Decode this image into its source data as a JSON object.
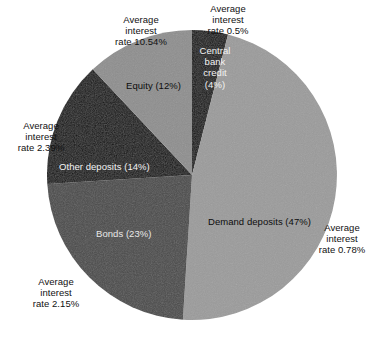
{
  "chart_data": {
    "type": "pie",
    "title": "",
    "subtitle": "",
    "xlabel": "",
    "ylabel": "",
    "legend_position": "none",
    "grid": false,
    "start_angle_deg": 0,
    "direction": "clockwise",
    "center": {
      "x": 192,
      "y": 175
    },
    "radius": 145,
    "categories": [
      "Central bank credit",
      "Demand deposits",
      "Bonds",
      "Other deposits",
      "Equity"
    ],
    "values": [
      4,
      47,
      23,
      14,
      12
    ],
    "value_unit": "percent",
    "total": 100,
    "slices": [
      {
        "name": "Central bank credit",
        "value": 4,
        "wedge_label": "Central\nbank\ncredit\n(4%)",
        "wedge_label_color": "#f2f2f2",
        "annotation": "Average\ninterest\nrate 0.5%",
        "average_interest_rate": 0.5,
        "color": "#0e0e0e",
        "start_angle_deg": 0,
        "end_angle_deg": 14.4
      },
      {
        "name": "Demand deposits",
        "value": 47,
        "wedge_label": "Demand deposits (47%)",
        "wedge_label_color": "#0d0d0d",
        "annotation": "Average\ninterest\nrate 0.78%",
        "average_interest_rate": 0.78,
        "color": "#9b9b9b",
        "start_angle_deg": 14.4,
        "end_angle_deg": 183.6
      },
      {
        "name": "Bonds",
        "value": 23,
        "wedge_label": "Bonds (23%)",
        "wedge_label_color": "#e8e8e8",
        "annotation": "Average\ninterest\nrate 2.15%",
        "average_interest_rate": 2.15,
        "color": "#4a4a4a",
        "start_angle_deg": 183.6,
        "end_angle_deg": 266.4
      },
      {
        "name": "Other deposits",
        "value": 14,
        "wedge_label": "Other deposits (14%)",
        "wedge_label_color": "#f2f2f2",
        "annotation": "Average\ninterest\nrate 2.39%",
        "average_interest_rate": 2.39,
        "color": "#0e0e0e",
        "start_angle_deg": 266.4,
        "end_angle_deg": 316.8
      },
      {
        "name": "Equity",
        "value": 12,
        "wedge_label": "Equity (12%)",
        "wedge_label_color": "#0d0d0d",
        "annotation": "Average\ninterest\nrate 10.54%",
        "average_interest_rate": 10.54,
        "color": "#8e8e8e",
        "start_angle_deg": 316.8,
        "end_angle_deg": 360
      }
    ]
  },
  "colors": {
    "background": "#ffffff",
    "text": "#111111",
    "black_wedge": "#0e0e0e",
    "dark_gray_wedge": "#4a4a4a",
    "mid_gray_wedge": "#8e8e8e",
    "light_gray_wedge": "#9b9b9b"
  }
}
